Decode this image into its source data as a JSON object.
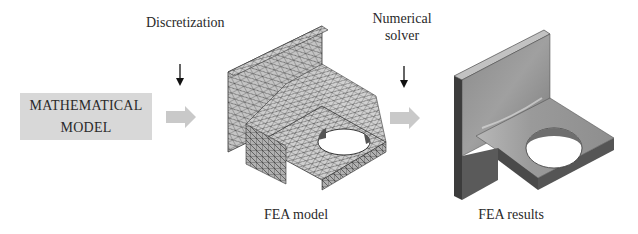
{
  "steps": {
    "math_model": {
      "line1": "MATHEMATICAL",
      "line2": "MODEL"
    },
    "discretization": {
      "label": "Discretization"
    },
    "numerical_solver": {
      "line1": "Numerical",
      "line2": "solver"
    },
    "fea_model": {
      "caption": "FEA model"
    },
    "fea_results": {
      "caption": "FEA results"
    }
  },
  "colors": {
    "box_fill": "#d8d8d8",
    "block_arrow": "#c8c8c8",
    "mesh_face": "#bdbdbd",
    "result_face": "#8c8c8c"
  }
}
